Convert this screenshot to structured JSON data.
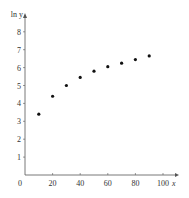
{
  "chart_data": {
    "type": "scatter",
    "title": "",
    "xlabel": "x",
    "ylabel": "ln y",
    "xlim": [
      0,
      100
    ],
    "ylim": [
      0,
      8
    ],
    "grid": false,
    "x": [
      10,
      20,
      30,
      40,
      50,
      60,
      70,
      80,
      90
    ],
    "series": [
      {
        "name": "ln y",
        "values": [
          3.4,
          4.4,
          5.0,
          5.45,
          5.8,
          6.05,
          6.25,
          6.45,
          6.65
        ]
      }
    ],
    "x_ticks": [
      "0",
      "20",
      "40",
      "60",
      "80",
      "100"
    ],
    "y_ticks": [
      "1",
      "2",
      "3",
      "4",
      "5",
      "6",
      "7",
      "8"
    ],
    "colors": {
      "axis": "#555555",
      "point": "#111111"
    }
  }
}
